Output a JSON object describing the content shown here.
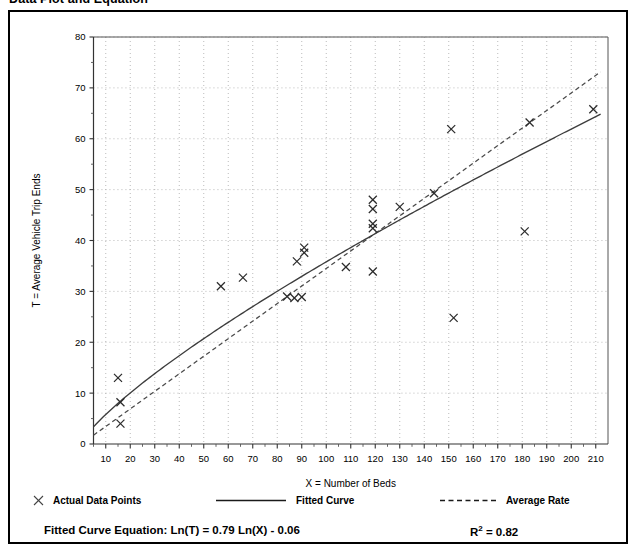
{
  "page": {
    "title": "Data Plot and Equation"
  },
  "chart_data": {
    "type": "scatter",
    "title": "Data Plot and Equation",
    "xlabel": "X = Number of Beds",
    "ylabel": "T = Average Vehicle Trip Ends",
    "xlim": [
      5,
      215
    ],
    "ylim": [
      0,
      80
    ],
    "xticks": [
      10,
      20,
      30,
      40,
      50,
      60,
      70,
      80,
      90,
      100,
      110,
      120,
      130,
      140,
      150,
      160,
      170,
      180,
      190,
      200,
      210
    ],
    "yticks": [
      0,
      10,
      20,
      30,
      40,
      50,
      60,
      70,
      80
    ],
    "grid": "dotted",
    "legend_position": "below-axes",
    "series": [
      {
        "name": "Actual Data Points",
        "type": "scatter",
        "marker": "x",
        "color": "#333333",
        "points": [
          [
            15,
            13.0
          ],
          [
            16,
            8.2
          ],
          [
            16,
            4.0
          ],
          [
            57,
            31.0
          ],
          [
            66,
            32.7
          ],
          [
            84,
            29.0
          ],
          [
            87,
            28.7
          ],
          [
            88,
            35.9
          ],
          [
            90,
            28.9
          ],
          [
            91,
            38.6
          ],
          [
            91,
            37.6
          ],
          [
            108,
            34.8
          ],
          [
            119,
            48.0
          ],
          [
            119,
            46.2
          ],
          [
            119,
            43.3
          ],
          [
            119,
            42.4
          ],
          [
            119,
            33.9
          ],
          [
            130,
            46.6
          ],
          [
            144,
            49.3
          ],
          [
            151,
            61.9
          ],
          [
            152,
            24.8
          ],
          [
            181,
            41.8
          ],
          [
            183,
            63.2
          ],
          [
            209,
            65.8
          ]
        ]
      },
      {
        "name": "Fitted Curve",
        "type": "line",
        "style": "solid",
        "color": "#3a3a3a",
        "equation": "Ln(T) = 0.79 Ln(X) - 0.06",
        "a": 0.79,
        "b": -0.06
      },
      {
        "name": "Average Rate",
        "type": "line",
        "style": "dashed",
        "color": "#3a3a3a",
        "slope": 0.345,
        "through_origin": true
      }
    ]
  },
  "legend": {
    "items": [
      {
        "label": "Actual Data Points",
        "marker": "x-marker"
      },
      {
        "label": "Fitted Curve",
        "marker": "solid-line"
      },
      {
        "label": "Average Rate",
        "marker": "dashed-line"
      }
    ]
  },
  "equation": {
    "label": "Fitted Curve Equation:  Ln(T) = 0.79 Ln(X) - 0.06",
    "r2_prefix": "R",
    "r2_exp": "2",
    "r2_value": " = 0.82"
  }
}
